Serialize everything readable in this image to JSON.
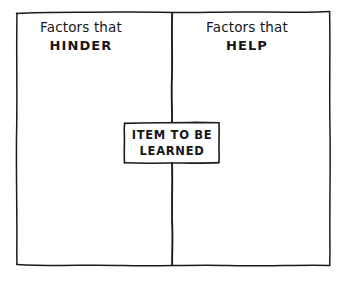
{
  "diagram": {
    "type": "force-field-analysis",
    "title_visible": false,
    "background_color": "#ffffff",
    "ink_color": "#16161a",
    "frame": {
      "name": "outer-frame",
      "style": "hand-drawn-rectangle",
      "x": 16,
      "y": 12,
      "width": 314,
      "height": 253
    },
    "divider": {
      "name": "vertical-divider",
      "orientation": "vertical",
      "x": 172,
      "y_top": 12,
      "y_bottom": 265,
      "style": "hand-drawn-line"
    },
    "columns": [
      {
        "id": "hinder",
        "side": "left",
        "line1": "Factors that",
        "line2": "HINDER"
      },
      {
        "id": "help",
        "side": "right",
        "line1": "Factors that",
        "line2": "HELP"
      }
    ],
    "center_box": {
      "name": "item-to-be-learned-box",
      "line1": "ITEM TO BE",
      "line2": "LEARNED",
      "x": 124,
      "y": 122,
      "width": 95,
      "height": 41,
      "style": "hand-drawn-rectangle"
    }
  }
}
